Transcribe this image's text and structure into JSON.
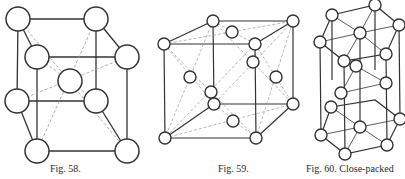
{
  "figures": [
    {
      "id": "fig58",
      "caption": "Fig. 58.",
      "type": "body-centered cubic unit cell"
    },
    {
      "id": "fig59",
      "caption": "Fig. 59.",
      "type": "face-centered cubic unit cell"
    },
    {
      "id": "fig60",
      "caption": "Fig. 60. Close-packed",
      "type": "hexagonal close-packed cell"
    }
  ],
  "colors": {
    "line": "#333333",
    "dashed": "#9a9a9a",
    "circle_fill": "#ffffff",
    "text": "#2a2a2a"
  }
}
